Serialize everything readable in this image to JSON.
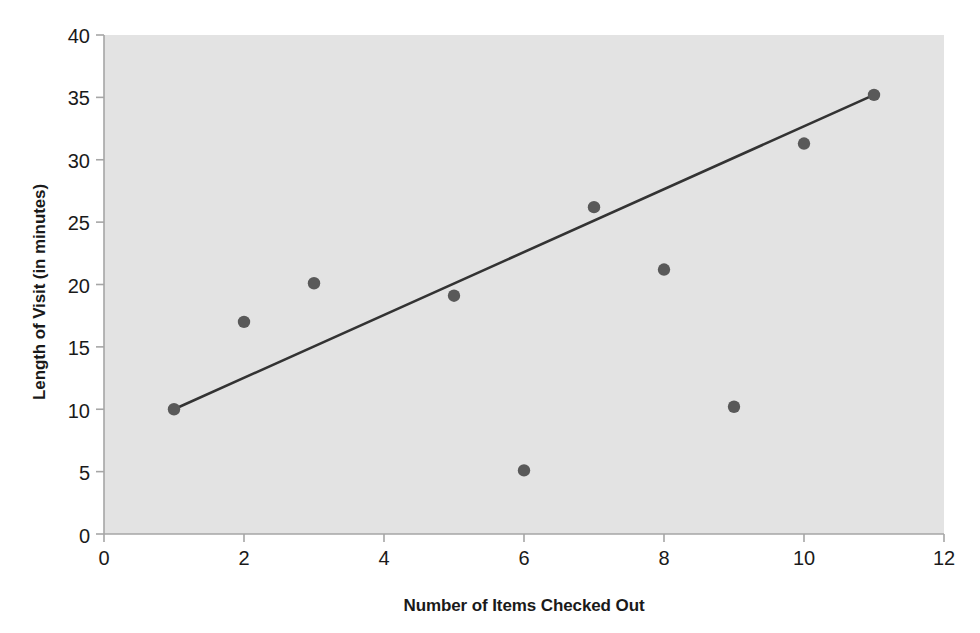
{
  "chart_data": {
    "type": "scatter",
    "title": "",
    "xlabel": "Number of Items Checked Out",
    "ylabel": "Length of Visit (in minutes)",
    "xlim": [
      0,
      12
    ],
    "ylim": [
      0,
      40
    ],
    "x_ticks": [
      0,
      2,
      4,
      6,
      8,
      10,
      12
    ],
    "y_ticks": [
      0,
      5,
      10,
      15,
      20,
      25,
      30,
      35,
      40
    ],
    "x_tick_labels": [
      "0",
      "2",
      "4",
      "6",
      "8",
      "10",
      "12"
    ],
    "y_tick_labels": [
      "0",
      "5",
      "10",
      "15",
      "20",
      "25",
      "30",
      "35",
      "40"
    ],
    "grid": false,
    "legend": null,
    "series": [
      {
        "name": "Observations",
        "marker": "circle",
        "color": "#595959",
        "points": [
          {
            "x": 1,
            "y": 10.0
          },
          {
            "x": 2,
            "y": 17.0
          },
          {
            "x": 3,
            "y": 20.1
          },
          {
            "x": 5,
            "y": 19.1
          },
          {
            "x": 6,
            "y": 5.1
          },
          {
            "x": 7,
            "y": 26.2
          },
          {
            "x": 8,
            "y": 21.2
          },
          {
            "x": 9,
            "y": 10.2
          },
          {
            "x": 10,
            "y": 31.3
          },
          {
            "x": 11,
            "y": 35.2
          }
        ]
      }
    ],
    "trendline": {
      "name": "Trend line",
      "color": "#333333",
      "x_start": 1,
      "y_start": 10.0,
      "x_end": 11,
      "y_end": 35.2
    },
    "plot_background_color": "#e3e3e3",
    "axis_color": "#a6a6a6",
    "text_color": "#1a1a1a"
  },
  "axis": {
    "y_title": "Length of Visit (in minutes)",
    "x_title": "Number of Items Checked Out"
  }
}
